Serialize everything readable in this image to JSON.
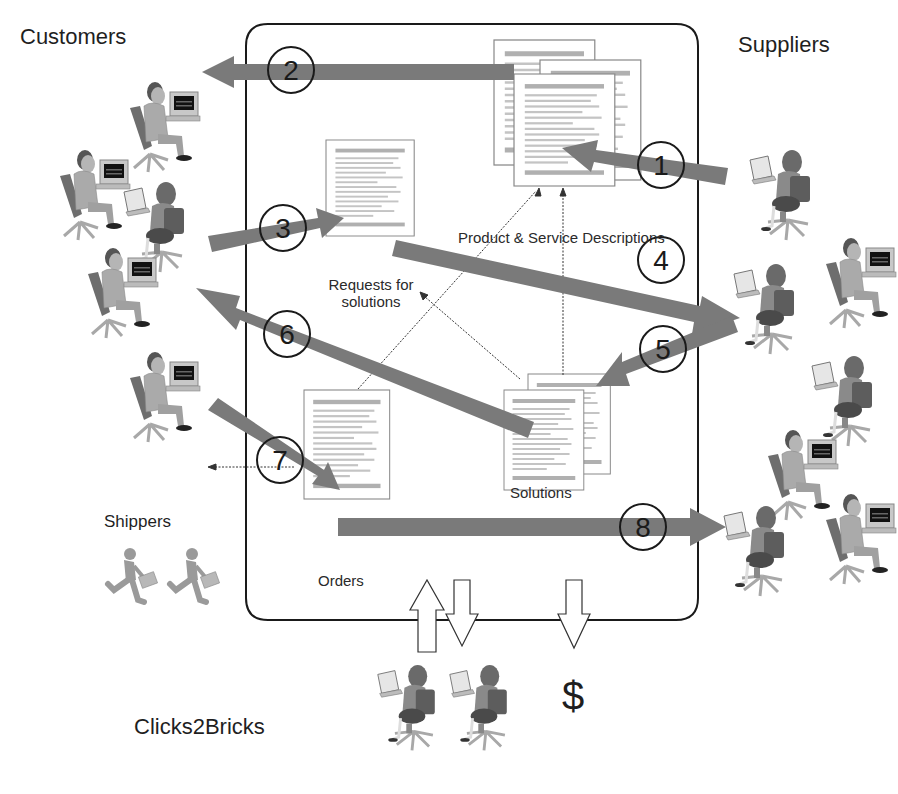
{
  "groups": {
    "customers": "Customers",
    "suppliers": "Suppliers",
    "shippers": "Shippers",
    "clicks2bricks": "Clicks2Bricks"
  },
  "documents": {
    "product_service": "Product & Service Descriptions",
    "requests_line1": "Requests for",
    "requests_line2": "solutions",
    "solutions": "Solutions",
    "orders": "Orders"
  },
  "steps": [
    {
      "n": "1",
      "from": "Suppliers",
      "to": "Product & Service Descriptions"
    },
    {
      "n": "2",
      "from": "Product & Service Descriptions",
      "to": "Customers"
    },
    {
      "n": "3",
      "from": "Customers",
      "to": "Requests for solutions"
    },
    {
      "n": "4",
      "from": "Requests for solutions",
      "to": "Suppliers"
    },
    {
      "n": "5",
      "from": "Suppliers",
      "to": "Solutions"
    },
    {
      "n": "6",
      "from": "Solutions",
      "to": "Customers"
    },
    {
      "n": "7",
      "from": "Customers",
      "to": "Orders"
    },
    {
      "n": "8",
      "from": "Orders",
      "to": "Suppliers"
    }
  ],
  "money_symbol": "$",
  "colors": {
    "arrow": "#7a7a7a",
    "outline": "#1a1a1a",
    "person": "#9a9a9a",
    "chair": "#6e6e6e"
  }
}
